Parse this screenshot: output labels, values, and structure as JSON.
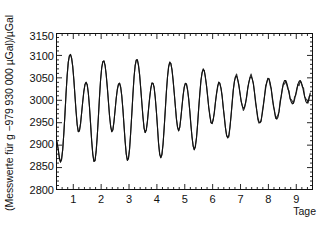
{
  "figure": {
    "background_color": "#ffffff",
    "ink_color": "#111111"
  },
  "chart_data": {
    "type": "line",
    "title": "",
    "subtitle": "",
    "xlabel": "Tage",
    "ylabel": "(Messwerte für g −979 930 000 µGal)/µGal",
    "xlim": [
      0.38,
      9.6
    ],
    "ylim": [
      2800,
      3150
    ],
    "xticks": [
      1,
      2,
      3,
      4,
      5,
      6,
      7,
      8,
      9
    ],
    "xtick_labels": [
      "1",
      "2",
      "3",
      "4",
      "5",
      "6",
      "7",
      "8",
      "9"
    ],
    "yticks": [
      2800,
      2850,
      2900,
      2950,
      3000,
      3050,
      3100,
      3150
    ],
    "ytick_labels": [
      "2800",
      "2850",
      "2900",
      "2950",
      "3000",
      "3050",
      "3100",
      "3150"
    ],
    "minor_xticks_per_major": 5,
    "minor_yticks_per_major": 5,
    "grid": false,
    "legend": null,
    "legend_position": "none",
    "line_color": "#111111",
    "line_width": 1.1,
    "series": [
      {
        "name": "Erdgezeiten-Schweremessung",
        "x": [
          0.38,
          0.42,
          0.46,
          0.5,
          0.54,
          0.58,
          0.62,
          0.66,
          0.7,
          0.74,
          0.78,
          0.82,
          0.86,
          0.9,
          0.94,
          0.98,
          1.02,
          1.06,
          1.1,
          1.14,
          1.18,
          1.22,
          1.26,
          1.3,
          1.34,
          1.38,
          1.42,
          1.46,
          1.5,
          1.54,
          1.58,
          1.62,
          1.66,
          1.7,
          1.74,
          1.78,
          1.82,
          1.86,
          1.9,
          1.94,
          1.98,
          2.02,
          2.06,
          2.1,
          2.14,
          2.18,
          2.22,
          2.26,
          2.3,
          2.34,
          2.38,
          2.42,
          2.46,
          2.5,
          2.54,
          2.58,
          2.62,
          2.66,
          2.7,
          2.74,
          2.78,
          2.82,
          2.86,
          2.9,
          2.94,
          2.98,
          3.02,
          3.06,
          3.1,
          3.14,
          3.18,
          3.22,
          3.26,
          3.3,
          3.34,
          3.38,
          3.42,
          3.46,
          3.5,
          3.54,
          3.58,
          3.62,
          3.66,
          3.7,
          3.74,
          3.78,
          3.82,
          3.86,
          3.9,
          3.94,
          3.98,
          4.02,
          4.06,
          4.1,
          4.14,
          4.18,
          4.22,
          4.26,
          4.3,
          4.34,
          4.38,
          4.42,
          4.46,
          4.5,
          4.54,
          4.58,
          4.62,
          4.66,
          4.7,
          4.74,
          4.78,
          4.82,
          4.86,
          4.9,
          4.94,
          4.98,
          5.02,
          5.06,
          5.1,
          5.14,
          5.18,
          5.22,
          5.26,
          5.3,
          5.34,
          5.38,
          5.42,
          5.46,
          5.5,
          5.54,
          5.58,
          5.62,
          5.66,
          5.7,
          5.74,
          5.78,
          5.82,
          5.86,
          5.9,
          5.94,
          5.98,
          6.02,
          6.06,
          6.1,
          6.14,
          6.18,
          6.22,
          6.26,
          6.3,
          6.34,
          6.38,
          6.42,
          6.46,
          6.5,
          6.54,
          6.58,
          6.62,
          6.66,
          6.7,
          6.74,
          6.78,
          6.82,
          6.86,
          6.9,
          6.94,
          6.98,
          7.02,
          7.06,
          7.1,
          7.14,
          7.18,
          7.22,
          7.26,
          7.3,
          7.34,
          7.38,
          7.42,
          7.46,
          7.5,
          7.54,
          7.58,
          7.62,
          7.66,
          7.7,
          7.74,
          7.78,
          7.82,
          7.86,
          7.9,
          7.94,
          7.98,
          8.02,
          8.06,
          8.1,
          8.14,
          8.18,
          8.22,
          8.26,
          8.3,
          8.34,
          8.38,
          8.42,
          8.46,
          8.5,
          8.54,
          8.58,
          8.62,
          8.66,
          8.7,
          8.74,
          8.78,
          8.82,
          8.86,
          8.9,
          8.94,
          8.98,
          9.02,
          9.06,
          9.1,
          9.14,
          9.18,
          9.22,
          9.26,
          9.3,
          9.34,
          9.38,
          9.42,
          9.46,
          9.5
        ],
        "y": [
          2915,
          2905,
          2890,
          2872,
          2862,
          2868,
          2890,
          2925,
          2968,
          3015,
          3055,
          3085,
          3099,
          3102,
          3094,
          3075,
          3046,
          3010,
          2975,
          2946,
          2930,
          2932,
          2948,
          2972,
          2998,
          3020,
          3035,
          3040,
          3034,
          3016,
          2986,
          2948,
          2910,
          2880,
          2864,
          2866,
          2886,
          2920,
          2962,
          3006,
          3046,
          3072,
          3086,
          3088,
          3078,
          3058,
          3030,
          2998,
          2966,
          2942,
          2930,
          2934,
          2952,
          2978,
          3004,
          3024,
          3036,
          3038,
          3030,
          3010,
          2980,
          2944,
          2908,
          2880,
          2866,
          2870,
          2892,
          2928,
          2970,
          3014,
          3052,
          3078,
          3090,
          3090,
          3078,
          3056,
          3026,
          2994,
          2962,
          2938,
          2928,
          2934,
          2954,
          2980,
          3006,
          3026,
          3038,
          3038,
          3028,
          3006,
          2976,
          2940,
          2904,
          2880,
          2872,
          2880,
          2902,
          2938,
          2978,
          3018,
          3052,
          3074,
          3084,
          3082,
          3068,
          3046,
          3018,
          2988,
          2960,
          2940,
          2932,
          2940,
          2960,
          2986,
          3010,
          3028,
          3038,
          3036,
          3024,
          3004,
          2976,
          2946,
          2918,
          2898,
          2890,
          2896,
          2916,
          2946,
          2982,
          3016,
          3044,
          3062,
          3070,
          3066,
          3052,
          3032,
          3008,
          2984,
          2964,
          2950,
          2948,
          2956,
          2974,
          2996,
          3016,
          3032,
          3040,
          3038,
          3026,
          3008,
          2984,
          2960,
          2938,
          2922,
          2916,
          2922,
          2940,
          2966,
          2996,
          3022,
          3042,
          3052,
          3054,
          3046,
          3032,
          3016,
          3000,
          2988,
          2982,
          2984,
          2994,
          3010,
          3026,
          3040,
          3050,
          3053,
          3048,
          3036,
          3018,
          2998,
          2978,
          2962,
          2952,
          2950,
          2956,
          2970,
          2988,
          3008,
          3026,
          3040,
          3048,
          3048,
          3040,
          3026,
          3008,
          2990,
          2974,
          2962,
          2958,
          2962,
          2974,
          2992,
          3010,
          3026,
          3038,
          3044,
          3044,
          3038,
          3028,
          3016,
          3004,
          2996,
          2992,
          2994,
          3002,
          3014,
          3026,
          3036,
          3042,
          3044,
          3040,
          3032,
          3020,
          3008,
          2998,
          2994,
          2996,
          3004,
          3016
        ],
        "trace_thickness_note": "Band thickens toward right side (measurement scatter)"
      }
    ],
    "annotations": []
  }
}
